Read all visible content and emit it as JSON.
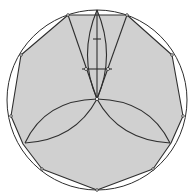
{
  "diagram": {
    "title": "",
    "polygon": {
      "sides": 11,
      "filled": true
    },
    "circle": {
      "count": 1
    },
    "construction": {
      "vertical_axis": true,
      "horizontal_tick": true,
      "lens_count": 3,
      "converging_lines": 2
    },
    "colors": {
      "background": "#ffffff",
      "polygon_fill": "#d0d0d0",
      "stroke": "#2e2e2e",
      "point_fill": "#ffffff"
    }
  }
}
